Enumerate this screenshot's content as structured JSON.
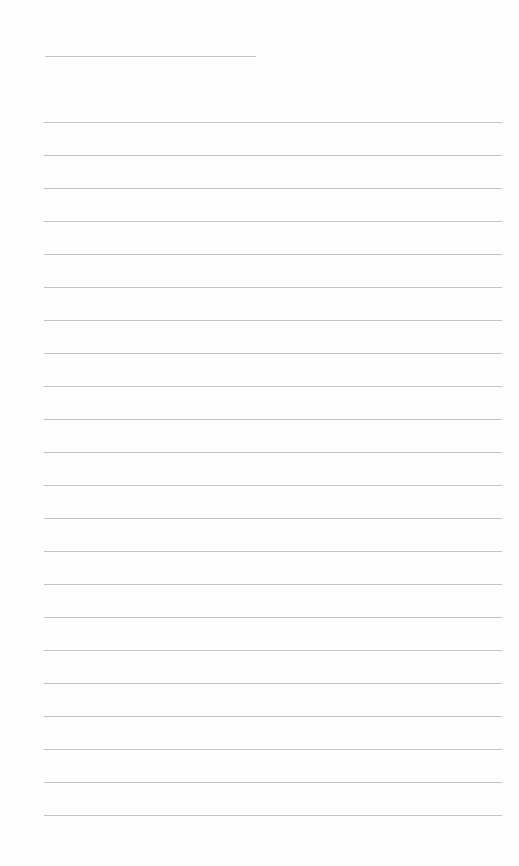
{
  "page": {
    "type": "lined-paper",
    "background": "#fefefe",
    "line_color": "#b8b8b8",
    "title_line": {
      "x": 45,
      "y": 56,
      "width": 211
    },
    "rules": {
      "x": 44,
      "width": 458,
      "first_y": 122,
      "spacing": 33,
      "count": 22
    }
  }
}
